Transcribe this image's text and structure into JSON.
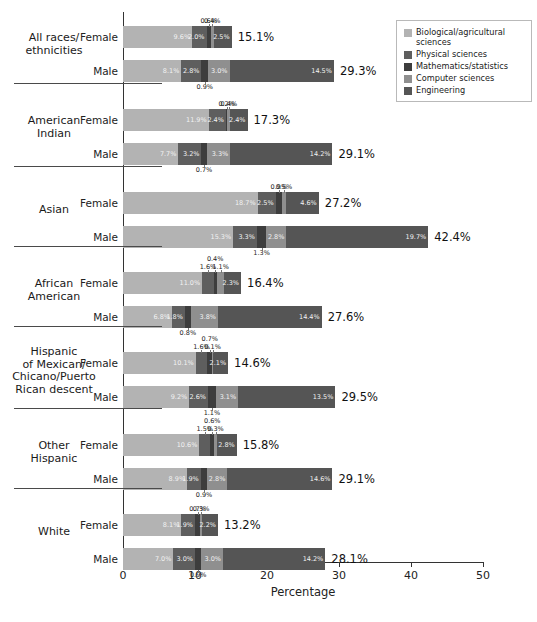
{
  "chart_data": {
    "type": "bar",
    "subtype": "stacked-horizontal-grouped",
    "title": "",
    "xlabel": "Percentage",
    "ylabel": "",
    "xlim": [
      0,
      50
    ],
    "xticks": [
      0,
      10,
      20,
      30,
      40,
      50
    ],
    "grid": false,
    "legend_position": "top-right",
    "series": [
      {
        "name": "Biological/agricultural sciences",
        "color": "#b3b3b3"
      },
      {
        "name": "Physical sciences",
        "color": "#5e5e5e"
      },
      {
        "name": "Mathematics/statistics",
        "color": "#3d3d3d"
      },
      {
        "name": "Computer sciences",
        "color": "#8f8f8f"
      },
      {
        "name": "Engineering",
        "color": "#555555"
      }
    ],
    "groups": [
      {
        "label": "All races/\nethnicities",
        "rows": [
          {
            "label": "Female",
            "values": [
              9.6,
              2.0,
              0.6,
              0.4,
              2.5
            ],
            "total": "15.1%",
            "labels": [
              "9.6%",
              "2.0%",
              "0.6%",
              "0.4%",
              "2.5%"
            ],
            "placement": [
              "in",
              "in",
              "above",
              "above",
              "in"
            ]
          },
          {
            "label": "Male",
            "values": [
              8.1,
              2.8,
              0.9,
              3.0,
              14.5
            ],
            "total": "29.3%",
            "labels": [
              "8.1%",
              "2.8%",
              "0.9%",
              "3.0%",
              "14.5%"
            ],
            "placement": [
              "in",
              "in",
              "below",
              "in",
              "in"
            ]
          }
        ]
      },
      {
        "label": "American\nIndian",
        "rows": [
          {
            "label": "Female",
            "values": [
              11.9,
              2.4,
              0.2,
              0.4,
              2.4
            ],
            "total": "17.3%",
            "labels": [
              "11.9%",
              "2.4%",
              "0.2%",
              "0.4%",
              "2.4%"
            ],
            "placement": [
              "in",
              "in",
              "above",
              "above",
              "in"
            ]
          },
          {
            "label": "Male",
            "values": [
              7.7,
              3.2,
              0.7,
              3.3,
              14.2
            ],
            "total": "29.1%",
            "labels": [
              "7.7%",
              "3.2%",
              "0.7%",
              "3.3%",
              "14.2%"
            ],
            "placement": [
              "in",
              "in",
              "below",
              "in",
              "in"
            ]
          }
        ]
      },
      {
        "label": "Asian",
        "rows": [
          {
            "label": "Female",
            "values": [
              18.7,
              2.5,
              0.9,
              0.5,
              4.6
            ],
            "total": "27.2%",
            "labels": [
              "18.7%",
              "2.5%",
              "0.9%",
              "0.5%",
              "4.6%"
            ],
            "placement": [
              "in",
              "in",
              "above",
              "above",
              "in"
            ]
          },
          {
            "label": "Male",
            "values": [
              15.3,
              3.3,
              1.3,
              2.8,
              19.7
            ],
            "total": "42.4%",
            "labels": [
              "15.3%",
              "3.3%",
              "1.3%",
              "2.8%",
              "19.7%"
            ],
            "placement": [
              "in",
              "in",
              "below",
              "in",
              "in"
            ]
          }
        ]
      },
      {
        "label": "African\nAmerican",
        "rows": [
          {
            "label": "Female",
            "values": [
              11.0,
              1.6,
              0.4,
              1.1,
              2.3
            ],
            "total": "16.4%",
            "labels": [
              "11.0%",
              "1.6%",
              "0.4%",
              "1.1%",
              "2.3%"
            ],
            "placement": [
              "in",
              "above",
              "above",
              "above",
              "in"
            ]
          },
          {
            "label": "Male",
            "values": [
              6.8,
              1.8,
              0.8,
              3.8,
              14.4
            ],
            "total": "27.6%",
            "labels": [
              "6.8%",
              "1.8%",
              "0.8%",
              "3.8%",
              "14.4%"
            ],
            "placement": [
              "in",
              "in",
              "below",
              "in",
              "in"
            ]
          }
        ]
      },
      {
        "label": "Hispanic\nof Mexican/\nChicano/Puerto\nRican descent",
        "rows": [
          {
            "label": "Female",
            "values": [
              10.1,
              1.6,
              0.7,
              0.1,
              2.1
            ],
            "total": "14.6%",
            "labels": [
              "10.1%",
              "1.6%",
              "0.7%",
              "0.1%",
              "2.1%"
            ],
            "placement": [
              "in",
              "above",
              "above",
              "above",
              "in"
            ]
          },
          {
            "label": "Male",
            "values": [
              9.2,
              2.6,
              1.1,
              3.1,
              13.5
            ],
            "total": "29.5%",
            "labels": [
              "9.2%",
              "2.6%",
              "1.1%",
              "3.1%",
              "13.5%"
            ],
            "placement": [
              "in",
              "in",
              "below",
              "in",
              "in"
            ]
          }
        ]
      },
      {
        "label": "Other\nHispanic",
        "rows": [
          {
            "label": "Female",
            "values": [
              10.6,
              1.5,
              0.6,
              0.3,
              2.8
            ],
            "total": "15.8%",
            "labels": [
              "10.6%",
              "1.5%",
              "0.6%",
              "0.3%",
              "2.8%"
            ],
            "placement": [
              "in",
              "above",
              "above",
              "above",
              "in"
            ]
          },
          {
            "label": "Male",
            "values": [
              8.9,
              1.9,
              0.9,
              2.8,
              14.6
            ],
            "total": "29.1%",
            "labels": [
              "8.9%",
              "1.9%",
              "0.9%",
              "2.8%",
              "14.6%"
            ],
            "placement": [
              "in",
              "in",
              "below",
              "in",
              "in"
            ]
          }
        ]
      },
      {
        "label": "White",
        "rows": [
          {
            "label": "Female",
            "values": [
              8.1,
              1.9,
              0.7,
              0.3,
              2.2
            ],
            "total": "13.2%",
            "labels": [
              "8.1%",
              "1.9%",
              "0.7%",
              "0.3%",
              "2.2%"
            ],
            "placement": [
              "in",
              "in",
              "above",
              "above",
              "in"
            ]
          },
          {
            "label": "Male",
            "values": [
              7.0,
              3.0,
              0.9,
              3.0,
              14.2
            ],
            "total": "28.1%",
            "labels": [
              "7.0%",
              "3.0%",
              "0.9%",
              "3.0%",
              "14.2%"
            ],
            "placement": [
              "in",
              "in",
              "below",
              "in",
              "in"
            ]
          }
        ]
      }
    ]
  },
  "legend": {
    "items": [
      {
        "label": "Biological/agricultural sciences",
        "color": "#b3b3b3"
      },
      {
        "label": "Physical sciences",
        "color": "#5e5e5e"
      },
      {
        "label": "Mathematics/statistics",
        "color": "#3d3d3d"
      },
      {
        "label": "Computer sciences",
        "color": "#8f8f8f"
      },
      {
        "label": "Engineering",
        "color": "#555555"
      }
    ]
  },
  "axis": {
    "x_title": "Percentage",
    "x_ticks": [
      "0",
      "10",
      "20",
      "30",
      "40",
      "50"
    ]
  },
  "caption": ""
}
